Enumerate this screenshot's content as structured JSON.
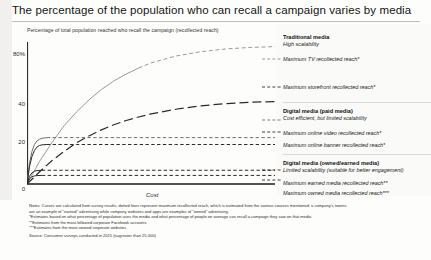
{
  "title": "The percentage of the population who can recall a campaign varies by media",
  "axis_caption": "Percentage of total population reached who recall the campaign (recollected reach)",
  "legend": {
    "groups": [
      {
        "heading": "Traditional media",
        "subheading": "High scalability",
        "items": [
          {
            "label": "Maximum TV recollected reach*"
          },
          {
            "label": "Maximum storefront recollected reach*"
          }
        ]
      },
      {
        "heading": "Digital media (paid media)",
        "subheading": "Cost efficient, but limited scalability",
        "items": [
          {
            "label": "Maximum online video recollected reach*"
          },
          {
            "label": "Maximum online banner recollected reach*"
          }
        ]
      },
      {
        "heading": "Digital media (owned/earned media)",
        "subheading": "Limited scalability (suitable for  better engagement)",
        "items": [
          {
            "label": "Maximum earned media recollected reach**"
          },
          {
            "label": "Maximum owned media recollected reach***"
          }
        ]
      }
    ]
  },
  "notes": [
    "Notes: Curves are calculated from survey results; dotted lines represent maximum recollected reach, which is estimated from the various sources mentioned; a company's tweets",
    "are an example of \"earned\" advertising while company websites and apps are examples of \"owned\" advertising.",
    "*Estimates based on what percentage of population uses the media and what percentage of people on average can recall a campaign they saw on that media",
    "**Estimates from the most-followed corporate Facebook accounts",
    "***Estimates from the most-viewed corporate websites"
  ],
  "source": "Source: Consumer surveys conducted in 2015 (n=greater than 25,000)",
  "colors": {
    "tv": "#9a9a9a",
    "storefront": "#2a2a2a",
    "online_video": "#6f6f6f",
    "online_banner": "#2a2a2a",
    "earned": "#2a2a2a",
    "owned": "#2a2a2a",
    "axis": "#1a1a1a",
    "rule": "#bdbdbd"
  },
  "chart_data": {
    "type": "line",
    "title": "The percentage of the population who can recall a campaign varies by media",
    "xlabel": "Cost",
    "ylabel": "Percentage of total population reached who recall the campaign (recollected reach)",
    "ylim": [
      0,
      85
    ],
    "xlim": [
      0,
      100
    ],
    "yticks": [
      "0",
      "20",
      "40",
      "80%"
    ],
    "ytick_values": [
      0,
      20,
      40,
      80
    ],
    "grid": false,
    "legend_position": "right",
    "series": [
      {
        "name": "Maximum TV recollected reach*",
        "style": "solid-then-dashed",
        "color": "#9a9a9a",
        "saturation_value": 80,
        "x": [
          0,
          5,
          10,
          15,
          20,
          25,
          30,
          35,
          40,
          45,
          50,
          60,
          70,
          80,
          90,
          100
        ],
        "y": [
          0,
          13,
          24,
          34,
          42,
          49,
          55,
          60,
          64,
          67.5,
          70.5,
          74.5,
          77,
          78.6,
          79.5,
          80
        ]
      },
      {
        "name": "Maximum storefront recollected reach*",
        "style": "long-dash",
        "color": "#2a2a2a",
        "saturation_value": 48,
        "x": [
          0,
          5,
          10,
          15,
          20,
          25,
          30,
          35,
          40,
          45,
          50,
          60,
          70,
          80,
          90,
          100
        ],
        "y": [
          0,
          7,
          13.5,
          19,
          24,
          28,
          31.5,
          34.5,
          37,
          39,
          40.8,
          43.5,
          45.5,
          46.8,
          47.6,
          48
        ]
      },
      {
        "name": "Maximum online video recollected reach*",
        "style": "solid-short-rise-then-dashed-plateau",
        "color": "#6f6f6f",
        "saturation_value": 27,
        "x": [
          0,
          1,
          2,
          3,
          4,
          5,
          6,
          8,
          10,
          20,
          40,
          60,
          80,
          100
        ],
        "y": [
          0,
          12,
          19,
          23,
          25,
          26,
          26.6,
          27,
          27,
          27,
          27,
          27,
          27,
          27
        ]
      },
      {
        "name": "Maximum online banner recollected reach*",
        "style": "solid-short-rise-then-dashed-plateau",
        "color": "#2a2a2a",
        "saturation_value": 23,
        "x": [
          0,
          1,
          2,
          3,
          4,
          5,
          6,
          8,
          10,
          20,
          40,
          60,
          80,
          100
        ],
        "y": [
          0,
          10,
          16,
          19.5,
          21.5,
          22.4,
          22.8,
          23,
          23,
          23,
          23,
          23,
          23,
          23
        ]
      },
      {
        "name": "Maximum earned media recollected reach**",
        "style": "solid-short-rise-then-dashed-plateau",
        "color": "#2a2a2a",
        "saturation_value": 8,
        "x": [
          0,
          1,
          2,
          3,
          4,
          6,
          10,
          20,
          40,
          60,
          80,
          100
        ],
        "y": [
          0,
          4.5,
          6.5,
          7.4,
          7.8,
          8,
          8,
          8,
          8,
          8,
          8,
          8
        ]
      },
      {
        "name": "Maximum owned media recollected reach***",
        "style": "solid-short-rise-then-dashed-plateau",
        "color": "#2a2a2a",
        "saturation_value": 5,
        "x": [
          0,
          1,
          2,
          3,
          4,
          6,
          10,
          20,
          40,
          60,
          80,
          100
        ],
        "y": [
          0,
          3,
          4.3,
          4.7,
          4.9,
          5,
          5,
          5,
          5,
          5,
          5,
          5
        ]
      }
    ]
  }
}
